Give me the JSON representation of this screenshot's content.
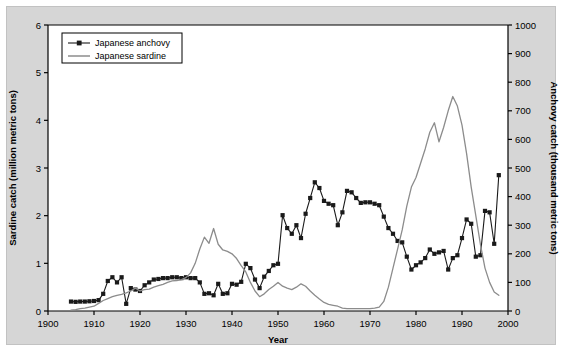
{
  "figure": {
    "background_color": "#d6d6d6",
    "plot_background_color": "#ffffff"
  },
  "axes": {
    "x": {
      "label": "Year",
      "ticks": [
        "1900",
        "1910",
        "1920",
        "1930",
        "1940",
        "1950",
        "1960",
        "1970",
        "1980",
        "1990",
        "2000"
      ],
      "min": 1900,
      "max": 2000
    },
    "y_left": {
      "label": "Sardine catch (million metric tons)",
      "ticks": [
        "0",
        "1",
        "2",
        "3",
        "4",
        "5",
        "6"
      ],
      "min": 0,
      "max": 6
    },
    "y_right": {
      "label": "Anchovy catch (thousand metric tons)",
      "ticks": [
        "0",
        "100",
        "200",
        "300",
        "400",
        "500",
        "600",
        "700",
        "800",
        "900",
        "1000"
      ],
      "min": 0,
      "max": 1000
    }
  },
  "legend": {
    "items": [
      {
        "label": "Japanese anchovy",
        "color": "#1a1a1a",
        "marker": "square"
      },
      {
        "label": "Japanese sardine",
        "color": "#8c8c8c",
        "marker": "none"
      }
    ]
  },
  "chart_data": {
    "type": "line",
    "title": "",
    "xlabel": "Year",
    "ylabel": "Sardine catch (million metric tons)",
    "ylabel_right": "Anchovy catch (thousand metric tons)",
    "xlim": [
      1900,
      2000
    ],
    "ylim": [
      0,
      6
    ],
    "ylim_right": [
      0,
      1000
    ],
    "grid": false,
    "legend_position": "top-left",
    "series": [
      {
        "name": "Japanese anchovy",
        "axis": "right",
        "units": "thousand metric tons",
        "color": "#1a1a1a",
        "marker": "square",
        "x": [
          1905,
          1906,
          1907,
          1908,
          1909,
          1910,
          1911,
          1912,
          1913,
          1914,
          1915,
          1916,
          1917,
          1918,
          1919,
          1920,
          1921,
          1922,
          1923,
          1924,
          1925,
          1926,
          1927,
          1928,
          1929,
          1930,
          1931,
          1932,
          1933,
          1934,
          1935,
          1936,
          1937,
          1938,
          1939,
          1940,
          1941,
          1942,
          1943,
          1944,
          1945,
          1946,
          1947,
          1948,
          1949,
          1950,
          1951,
          1952,
          1953,
          1954,
          1955,
          1956,
          1957,
          1958,
          1959,
          1960,
          1961,
          1962,
          1963,
          1964,
          1965,
          1966,
          1967,
          1968,
          1969,
          1970,
          1971,
          1972,
          1973,
          1974,
          1975,
          1976,
          1977,
          1978,
          1979,
          1980,
          1981,
          1982,
          1983,
          1984,
          1985,
          1986,
          1987,
          1988,
          1989,
          1990,
          1991,
          1992,
          1993,
          1994,
          1995,
          1996,
          1997,
          1998
        ],
        "y": [
          33,
          32,
          33,
          33,
          34,
          35,
          38,
          60,
          105,
          118,
          100,
          118,
          25,
          80,
          75,
          70,
          90,
          100,
          110,
          112,
          115,
          115,
          118,
          118,
          115,
          118,
          115,
          115,
          100,
          60,
          62,
          55,
          95,
          60,
          62,
          95,
          92,
          102,
          165,
          150,
          110,
          80,
          120,
          140,
          160,
          165,
          335,
          290,
          270,
          300,
          255,
          340,
          395,
          450,
          430,
          385,
          375,
          370,
          300,
          345,
          420,
          415,
          395,
          378,
          380,
          380,
          375,
          370,
          330,
          290,
          270,
          245,
          240,
          190,
          145,
          160,
          170,
          185,
          215,
          200,
          205,
          210,
          145,
          185,
          195,
          255,
          320,
          305,
          190,
          195,
          350,
          345,
          235,
          475
        ]
      },
      {
        "name": "Japanese sardine",
        "axis": "left",
        "units": "million metric tons",
        "color": "#8c8c8c",
        "marker": "none",
        "x": [
          1905,
          1906,
          1907,
          1908,
          1909,
          1910,
          1911,
          1912,
          1913,
          1914,
          1915,
          1916,
          1917,
          1918,
          1919,
          1920,
          1921,
          1922,
          1923,
          1924,
          1925,
          1926,
          1927,
          1928,
          1929,
          1930,
          1931,
          1932,
          1933,
          1934,
          1935,
          1936,
          1937,
          1938,
          1939,
          1940,
          1941,
          1942,
          1943,
          1944,
          1945,
          1946,
          1947,
          1948,
          1949,
          1950,
          1951,
          1952,
          1953,
          1954,
          1955,
          1956,
          1957,
          1958,
          1959,
          1960,
          1961,
          1962,
          1963,
          1964,
          1965,
          1966,
          1967,
          1968,
          1969,
          1970,
          1971,
          1972,
          1973,
          1974,
          1975,
          1976,
          1977,
          1978,
          1979,
          1980,
          1981,
          1982,
          1983,
          1984,
          1985,
          1986,
          1987,
          1988,
          1989,
          1990,
          1991,
          1992,
          1993,
          1994,
          1995,
          1996,
          1997,
          1998
        ],
        "y": [
          0.02,
          0.03,
          0.05,
          0.06,
          0.08,
          0.1,
          0.16,
          0.22,
          0.26,
          0.3,
          0.33,
          0.35,
          0.38,
          0.42,
          0.48,
          0.42,
          0.45,
          0.46,
          0.5,
          0.53,
          0.56,
          0.6,
          0.63,
          0.64,
          0.66,
          0.7,
          0.8,
          1.0,
          1.3,
          1.55,
          1.42,
          1.73,
          1.4,
          1.28,
          1.25,
          1.2,
          1.1,
          0.95,
          0.82,
          0.6,
          0.42,
          0.3,
          0.36,
          0.45,
          0.52,
          0.6,
          0.52,
          0.48,
          0.45,
          0.5,
          0.57,
          0.52,
          0.42,
          0.33,
          0.25,
          0.18,
          0.14,
          0.12,
          0.1,
          0.06,
          0.05,
          0.05,
          0.05,
          0.05,
          0.05,
          0.05,
          0.06,
          0.08,
          0.2,
          0.5,
          0.9,
          1.3,
          1.7,
          2.2,
          2.6,
          2.8,
          3.1,
          3.4,
          3.75,
          3.95,
          3.55,
          3.85,
          4.2,
          4.5,
          4.3,
          3.9,
          3.3,
          2.6,
          2.0,
          1.4,
          0.9,
          0.6,
          0.4,
          0.33
        ]
      }
    ]
  }
}
